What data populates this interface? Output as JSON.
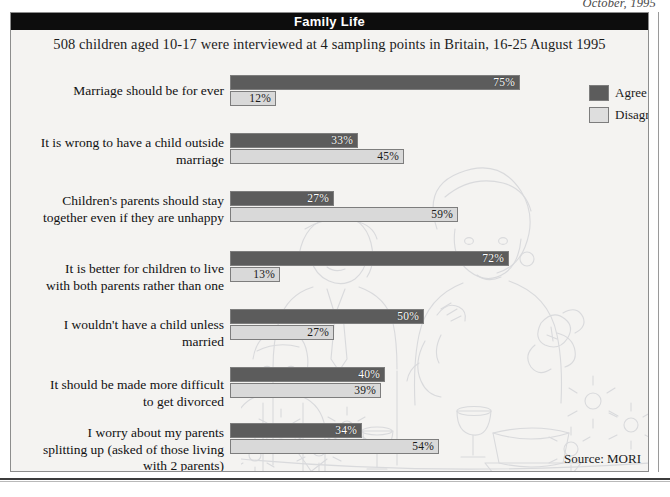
{
  "page": {
    "date": "October, 1995",
    "source": "Source: MORI"
  },
  "chart": {
    "title": "Family Life",
    "subtitle": "508 children aged 10-17 were interviewed at 4 sampling points in Britain, 16-25 August 1995"
  },
  "legend": {
    "agree_label": "Agree",
    "disagree_label": "Disagree"
  },
  "colors": {
    "agree": "#5c5c5c",
    "disagree": "#d9d9d9",
    "title_bar": "#0d0d0d",
    "panel_bg": "#f4f3f1",
    "border": "#8d8d8d"
  },
  "chart_data": {
    "type": "bar",
    "orientation": "horizontal",
    "title": "Family Life",
    "subtitle": "508 children aged 10-17 were interviewed at 4 sampling points in Britain, 16-25 August 1995",
    "xlabel": "",
    "ylabel": "",
    "xlim": [
      0,
      80
    ],
    "grid": false,
    "legend_position": "right-top",
    "unit": "%",
    "source": "Source: MORI",
    "categories": [
      "Marriage should be for ever",
      "It is wrong to have a child outside marriage",
      "Children's parents should stay together even if they are unhappy",
      "It is better for children to live with both parents rather than one",
      "I wouldn't have a child unless married",
      "It should be made more difficult to get divorced",
      "I worry about my parents splitting up (asked of those living with 2 parents)"
    ],
    "series": [
      {
        "name": "Agree",
        "values": [
          75,
          33,
          27,
          72,
          50,
          40,
          34
        ]
      },
      {
        "name": "Disagree",
        "values": [
          12,
          45,
          59,
          13,
          27,
          39,
          54
        ]
      }
    ]
  },
  "rows": [
    {
      "label_lines": [
        "Marriage should be for ever"
      ],
      "agree": 75,
      "disagree": 12,
      "agree_text": "75%",
      "disagree_text": "12%"
    },
    {
      "label_lines": [
        "It is wrong to have a child outside",
        "marriage"
      ],
      "agree": 33,
      "disagree": 45,
      "agree_text": "33%",
      "disagree_text": "45%"
    },
    {
      "label_lines": [
        "Children's parents should stay",
        "together even if they are unhappy"
      ],
      "agree": 27,
      "disagree": 59,
      "agree_text": "27%",
      "disagree_text": "59%"
    },
    {
      "label_lines": [
        "It is better for children to live",
        "with both parents rather than one"
      ],
      "agree": 72,
      "disagree": 13,
      "agree_text": "72%",
      "disagree_text": "13%"
    },
    {
      "label_lines": [
        "I wouldn't have a child unless",
        "married"
      ],
      "agree": 50,
      "disagree": 27,
      "agree_text": "50%",
      "disagree_text": "27%"
    },
    {
      "label_lines": [
        "It should be made more difficult",
        "to get divorced"
      ],
      "agree": 40,
      "disagree": 39,
      "agree_text": "40%",
      "disagree_text": "39%"
    },
    {
      "label_lines": [
        "I worry about my parents",
        "splitting up (asked of those living",
        "with 2 parents)"
      ],
      "agree": 34,
      "disagree": 54,
      "agree_text": "34%",
      "disagree_text": "54%"
    }
  ]
}
